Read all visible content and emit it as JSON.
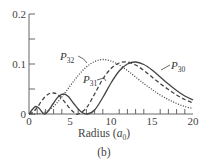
{
  "chart_data": {
    "type": "line",
    "title": "",
    "caption": "(b)",
    "xlabel": "Radius (a₀)",
    "xlabel_main": "Radius (",
    "xlabel_var": "a",
    "xlabel_sub": "0",
    "xlabel_close": ")",
    "ylabel": "",
    "xlim": [
      0,
      20
    ],
    "ylim": [
      0,
      0.2
    ],
    "x_ticks": [
      0,
      5,
      10,
      15,
      20
    ],
    "x_tick_labels": [
      "0",
      "5",
      "10",
      "15",
      "20"
    ],
    "y_ticks": [
      0,
      0.1,
      0.2
    ],
    "y_tick_labels": [
      "0",
      "0.1",
      "0.2"
    ],
    "grid": false,
    "series": [
      {
        "name": "P30",
        "label_main": "P",
        "label_sub": "30",
        "style": "solid",
        "x": [
          0,
          0.4,
          0.8,
          1.2,
          1.6,
          1.9,
          2.3,
          3,
          3.6,
          4.2,
          4.8,
          5.5,
          6.3,
          7.1,
          8,
          9,
          10,
          11,
          12,
          13,
          14,
          15,
          16,
          17,
          18,
          19,
          20
        ],
        "values": [
          0,
          0.009,
          0.015,
          0.012,
          0.004,
          0,
          0.005,
          0.022,
          0.035,
          0.04,
          0.035,
          0.02,
          0.005,
          0,
          0.008,
          0.033,
          0.062,
          0.086,
          0.1,
          0.104,
          0.099,
          0.088,
          0.074,
          0.06,
          0.047,
          0.036,
          0.028
        ]
      },
      {
        "name": "P31",
        "label_main": "P",
        "label_sub": "31",
        "style": "dashed",
        "x": [
          0,
          0.5,
          1,
          1.5,
          2,
          2.5,
          3,
          3.5,
          4,
          4.5,
          5,
          5.5,
          6,
          7,
          8,
          9,
          10,
          11,
          12,
          13,
          14,
          15,
          16,
          17,
          18,
          19,
          20
        ],
        "values": [
          0,
          0.004,
          0.013,
          0.025,
          0.035,
          0.041,
          0.042,
          0.039,
          0.031,
          0.021,
          0.011,
          0.003,
          0,
          0.012,
          0.04,
          0.07,
          0.091,
          0.102,
          0.104,
          0.098,
          0.087,
          0.074,
          0.061,
          0.049,
          0.038,
          0.029,
          0.022
        ]
      },
      {
        "name": "P32",
        "label_main": "P",
        "label_sub": "32",
        "style": "dotted",
        "x": [
          0,
          1,
          2,
          3,
          4,
          5,
          6,
          7,
          8,
          9,
          10,
          11,
          12,
          13,
          14,
          15,
          16,
          17,
          18,
          19,
          20
        ],
        "values": [
          0,
          0.0003,
          0.004,
          0.015,
          0.034,
          0.056,
          0.077,
          0.094,
          0.105,
          0.109,
          0.106,
          0.098,
          0.087,
          0.074,
          0.061,
          0.049,
          0.038,
          0.029,
          0.021,
          0.015,
          0.011
        ]
      }
    ],
    "annotations": [
      {
        "text": "P32",
        "x": 7.5,
        "y": 0.1
      },
      {
        "text": "P31",
        "x": 10.5,
        "y": 0.067
      },
      {
        "text": "P30",
        "x": 15.8,
        "y": 0.098
      }
    ]
  }
}
